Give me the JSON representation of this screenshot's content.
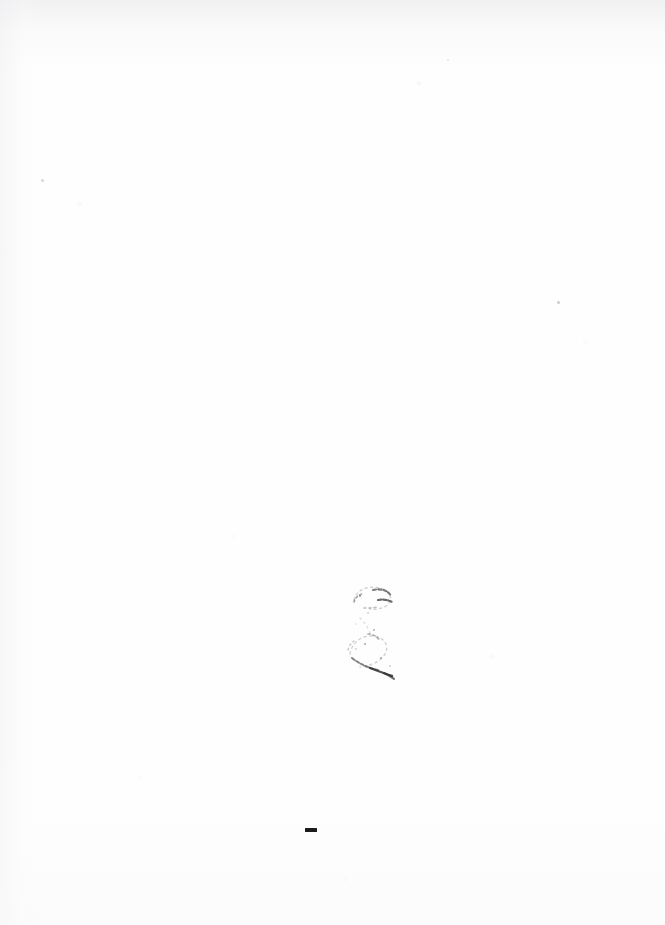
{
  "document": {
    "page_kind": "blank-scanned-page",
    "page_label": "",
    "body_text": "",
    "caption": "Blank scanned page",
    "background_color": "#fefefe",
    "ink_color": "#1b1b1b",
    "speck_color": "#b9b9bd"
  },
  "marks": {
    "pen_glyph": {
      "name": "handwritten-3-glyph",
      "transcription": "3",
      "note": "faded two-arc pen stroke",
      "color": "#2a2a2a"
    },
    "dash": {
      "name": "ink-dash",
      "transcription": "-",
      "color": "#1b1b1b"
    },
    "specks": [
      {
        "name": "speck-right"
      },
      {
        "name": "speck-left"
      },
      {
        "name": "speck-mid"
      }
    ]
  }
}
